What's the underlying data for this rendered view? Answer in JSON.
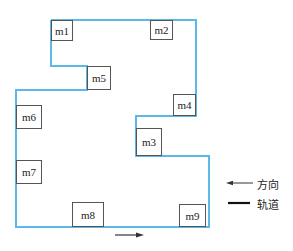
{
  "colors": {
    "track": "#5bb8e8",
    "box_border": "#555555",
    "arrow": "#222222"
  },
  "machines": [
    {
      "id": "m1",
      "label": "m1",
      "x": 51,
      "y": 20,
      "w": 22,
      "h": 21
    },
    {
      "id": "m2",
      "label": "m2",
      "x": 150,
      "y": 20,
      "w": 23,
      "h": 20
    },
    {
      "id": "m5",
      "label": "m5",
      "x": 87,
      "y": 66,
      "w": 24,
      "h": 24
    },
    {
      "id": "m4",
      "label": "m4",
      "x": 173,
      "y": 94,
      "w": 23,
      "h": 22
    },
    {
      "id": "m6",
      "label": "m6",
      "x": 16,
      "y": 105,
      "w": 26,
      "h": 24
    },
    {
      "id": "m3",
      "label": "m3",
      "x": 136,
      "y": 128,
      "w": 26,
      "h": 28
    },
    {
      "id": "m7",
      "label": "m7",
      "x": 16,
      "y": 160,
      "w": 26,
      "h": 24
    },
    {
      "id": "m8",
      "label": "m8",
      "x": 72,
      "y": 202,
      "w": 32,
      "h": 25
    },
    {
      "id": "m9",
      "label": "m9",
      "x": 179,
      "y": 204,
      "w": 27,
      "h": 23
    }
  ],
  "legend": {
    "direction_label": "方向",
    "track_label": "轨道"
  }
}
